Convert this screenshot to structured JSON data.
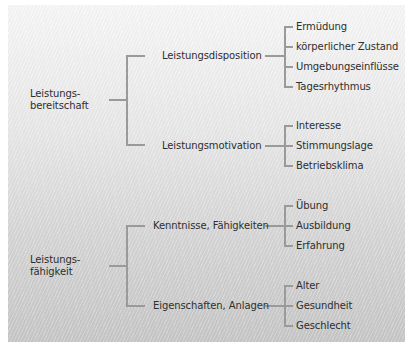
{
  "diagram": {
    "type": "tree",
    "line_color": "#9a9a9a",
    "roots": [
      {
        "label_line1": "Leistungs-",
        "label_line2": "bereitschaft",
        "children": [
          {
            "label": "Leistungsdisposition",
            "items": [
              "Ermüdung",
              "körperlicher Zustand",
              "Umgebungseinflüsse",
              "Tagesrhythmus"
            ]
          },
          {
            "label": "Leistungsmotivation",
            "items": [
              "Interesse",
              "Stimmungslage",
              "Betriebsklima"
            ]
          }
        ]
      },
      {
        "label_line1": "Leistungs-",
        "label_line2": "fähigkeit",
        "children": [
          {
            "label": "Kenntnisse, Fähigkeiten",
            "items": [
              "Übung",
              "Ausbildung",
              "Erfahrung"
            ]
          },
          {
            "label": "Eigenschaften, Anlagen",
            "items": [
              "Alter",
              "Gesundheit",
              "Geschlecht"
            ]
          }
        ]
      }
    ]
  }
}
